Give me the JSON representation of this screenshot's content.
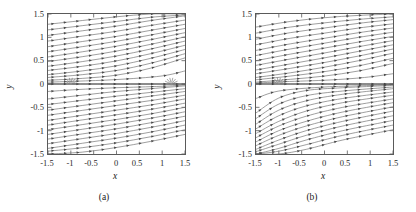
{
  "figure": {
    "panels": [
      {
        "id": "a",
        "caption": "(a)",
        "xlabel": "x",
        "ylabel": "y"
      },
      {
        "id": "b",
        "caption": "(b)",
        "xlabel": "x",
        "ylabel": "y"
      }
    ]
  },
  "axes": {
    "xticks": [
      "-1.5",
      "-1",
      "-0.5",
      "0",
      "0.5",
      "1",
      "1.5"
    ],
    "yticks": [
      "1.5",
      "1",
      "0.5",
      "0",
      "-0.5",
      "-1",
      "-1.5"
    ],
    "xtick_values": [
      -1.5,
      -1,
      -0.5,
      0,
      0.5,
      1,
      1.5
    ],
    "ytick_values": [
      1.5,
      1,
      0.5,
      0,
      -0.5,
      -1,
      -1.5
    ]
  },
  "colors": {
    "background": "#ffffff",
    "frame": "#5a5a5a",
    "streamline": "#6b6b6b",
    "arrow": "#4a4a4a",
    "text": "#1a1a1a",
    "ticklabel": "#2a2a2a"
  },
  "chart_data": [
    {
      "type": "line",
      "title": "",
      "subtitle": "",
      "xlabel": "x",
      "ylabel": "y",
      "xlim": [
        -1.5,
        1.5
      ],
      "ylim": [
        -1.5,
        1.5
      ],
      "grid": false,
      "legend": null,
      "plot_kind": "vector-field-streamlines",
      "annotations": [
        {
          "label": "convergence node",
          "x": -1.0,
          "y": 0.0
        },
        {
          "label": "convergence node",
          "x": 1.2,
          "y": 0.0
        },
        {
          "label": "horizontal separatrix",
          "x": 0.0,
          "y": 0.0
        }
      ],
      "description": "Streamline / arrow vector field on square domain; nearly parallel streamlines inclined upward to the right in upper and lower halves, with a horizontal separatrix along y=0 and converging nodes near x=-1 and x=1.2 on the axis.",
      "series": [
        {
          "name": "y=1.40",
          "x": [
            -1.5,
            -0.75,
            0.0,
            0.75,
            1.5
          ],
          "values": [
            1.28,
            1.36,
            1.44,
            1.5,
            1.5
          ]
        },
        {
          "name": "y=1.20",
          "x": [
            -1.5,
            -0.75,
            0.0,
            0.75,
            1.5
          ],
          "values": [
            1.04,
            1.14,
            1.24,
            1.36,
            1.46
          ]
        },
        {
          "name": "y=1.00",
          "x": [
            -1.5,
            -0.75,
            0.0,
            0.75,
            1.5
          ],
          "values": [
            0.8,
            0.91,
            1.02,
            1.15,
            1.28
          ]
        },
        {
          "name": "y=0.80",
          "x": [
            -1.5,
            -0.75,
            0.0,
            0.75,
            1.5
          ],
          "values": [
            0.58,
            0.69,
            0.81,
            0.95,
            1.1
          ]
        },
        {
          "name": "y=0.60",
          "x": [
            -1.5,
            -0.75,
            0.0,
            0.75,
            1.5
          ],
          "values": [
            0.38,
            0.48,
            0.6,
            0.75,
            0.92
          ]
        },
        {
          "name": "y=0.40",
          "x": [
            -1.5,
            -0.75,
            0.0,
            0.75,
            1.5
          ],
          "values": [
            0.2,
            0.28,
            0.39,
            0.55,
            0.74
          ]
        },
        {
          "name": "y=0.20",
          "x": [
            -1.5,
            -0.75,
            0.0,
            0.75,
            1.5
          ],
          "values": [
            0.08,
            0.12,
            0.19,
            0.34,
            0.56
          ]
        },
        {
          "name": "y=0.00",
          "x": [
            -1.5,
            -1.0,
            0.0,
            1.2,
            1.5
          ],
          "values": [
            0.0,
            0.0,
            0.0,
            0.0,
            0.0
          ]
        },
        {
          "name": "y=-0.20",
          "x": [
            -1.5,
            -0.75,
            0.0,
            0.75,
            1.5
          ],
          "values": [
            -0.32,
            -0.24,
            -0.16,
            -0.1,
            -0.04
          ]
        },
        {
          "name": "y=-0.40",
          "x": [
            -1.5,
            -0.75,
            0.0,
            0.75,
            1.5
          ],
          "values": [
            -0.56,
            -0.46,
            -0.36,
            -0.26,
            -0.16
          ]
        },
        {
          "name": "y=-0.60",
          "x": [
            -1.5,
            -0.75,
            0.0,
            0.75,
            1.5
          ],
          "values": [
            -0.78,
            -0.67,
            -0.56,
            -0.45,
            -0.32
          ]
        },
        {
          "name": "y=-0.80",
          "x": [
            -1.5,
            -0.75,
            0.0,
            0.75,
            1.5
          ],
          "values": [
            -0.98,
            -0.87,
            -0.76,
            -0.64,
            -0.5
          ]
        },
        {
          "name": "y=-1.00",
          "x": [
            -1.5,
            -0.75,
            0.0,
            0.75,
            1.5
          ],
          "values": [
            -1.18,
            -1.07,
            -0.96,
            -0.83,
            -0.69
          ]
        },
        {
          "name": "y=-1.20",
          "x": [
            -1.5,
            -0.75,
            0.0,
            0.75,
            1.5
          ],
          "values": [
            -1.38,
            -1.27,
            -1.16,
            -1.03,
            -0.88
          ]
        },
        {
          "name": "y=-1.40",
          "x": [
            -1.5,
            -0.75,
            0.0,
            0.75,
            1.5
          ],
          "values": [
            -1.5,
            -1.46,
            -1.36,
            -1.23,
            -1.08
          ]
        }
      ]
    },
    {
      "type": "line",
      "title": "",
      "subtitle": "",
      "xlabel": "x",
      "ylabel": "y",
      "xlim": [
        -1.5,
        1.5
      ],
      "ylim": [
        -1.5,
        1.5
      ],
      "grid": false,
      "legend": null,
      "plot_kind": "vector-field-streamlines",
      "annotations": [
        {
          "label": "separation point",
          "x": -1.0,
          "y": 0.0
        },
        {
          "label": "horizontal separatrix",
          "x": 0.2,
          "y": 0.0
        }
      ],
      "description": "Streamline / arrow vector field on square domain; a strong separation point at x=-1, y=0 where flow splits; streamlines in the lower-left sweep steeply upward and to the right, upper streamlines flatten toward the right boundary.",
      "series": [
        {
          "name": "y=1.40",
          "x": [
            -1.5,
            -0.75,
            0.0,
            0.75,
            1.5
          ],
          "values": [
            1.22,
            1.34,
            1.42,
            1.47,
            1.5
          ]
        },
        {
          "name": "y=1.20",
          "x": [
            -1.5,
            -0.75,
            0.0,
            0.75,
            1.5
          ],
          "values": [
            0.96,
            1.1,
            1.2,
            1.3,
            1.38
          ]
        },
        {
          "name": "y=1.00",
          "x": [
            -1.5,
            -0.75,
            0.0,
            0.75,
            1.5
          ],
          "values": [
            0.72,
            0.86,
            0.98,
            1.1,
            1.2
          ]
        },
        {
          "name": "y=0.80",
          "x": [
            -1.5,
            -0.75,
            0.0,
            0.75,
            1.5
          ],
          "values": [
            0.5,
            0.64,
            0.77,
            0.9,
            1.02
          ]
        },
        {
          "name": "y=0.60",
          "x": [
            -1.5,
            -0.75,
            0.0,
            0.75,
            1.5
          ],
          "values": [
            0.3,
            0.43,
            0.56,
            0.7,
            0.84
          ]
        },
        {
          "name": "y=0.40",
          "x": [
            -1.5,
            -0.75,
            0.0,
            0.75,
            1.5
          ],
          "values": [
            0.14,
            0.24,
            0.36,
            0.5,
            0.66
          ]
        },
        {
          "name": "y=0.20",
          "x": [
            -1.5,
            -0.75,
            0.0,
            0.75,
            1.5
          ],
          "values": [
            0.04,
            0.1,
            0.17,
            0.28,
            0.44
          ]
        },
        {
          "name": "y=0.00",
          "x": [
            -1.5,
            -1.0,
            0.2,
            1.0,
            1.5
          ],
          "values": [
            0.0,
            0.0,
            0.0,
            0.0,
            0.0
          ]
        },
        {
          "name": "y=-0.20",
          "x": [
            -1.5,
            -1.0,
            -0.4,
            0.4,
            1.5
          ],
          "values": [
            -0.62,
            -0.3,
            -0.14,
            -0.08,
            -0.03
          ]
        },
        {
          "name": "y=-0.40",
          "x": [
            -1.5,
            -1.0,
            -0.4,
            0.4,
            1.5
          ],
          "values": [
            -0.86,
            -0.56,
            -0.36,
            -0.22,
            -0.1
          ]
        },
        {
          "name": "y=-0.60",
          "x": [
            -1.5,
            -1.0,
            -0.4,
            0.4,
            1.5
          ],
          "values": [
            -1.06,
            -0.8,
            -0.58,
            -0.4,
            -0.24
          ]
        },
        {
          "name": "y=-0.80",
          "x": [
            -1.5,
            -1.0,
            -0.4,
            0.4,
            1.5
          ],
          "values": [
            -1.24,
            -1.0,
            -0.8,
            -0.6,
            -0.4
          ]
        },
        {
          "name": "y=-1.00",
          "x": [
            -1.5,
            -1.0,
            -0.4,
            0.4,
            1.5
          ],
          "values": [
            -1.4,
            -1.2,
            -1.0,
            -0.8,
            -0.58
          ]
        },
        {
          "name": "y=-1.20",
          "x": [
            -1.5,
            -1.0,
            -0.4,
            0.4,
            1.5
          ],
          "values": [
            -1.5,
            -1.38,
            -1.2,
            -1.0,
            -0.78
          ]
        },
        {
          "name": "y=-1.40",
          "x": [
            -1.5,
            -1.0,
            -0.4,
            0.4,
            1.5
          ],
          "values": [
            -1.5,
            -1.5,
            -1.4,
            -1.2,
            -0.98
          ]
        }
      ]
    }
  ]
}
